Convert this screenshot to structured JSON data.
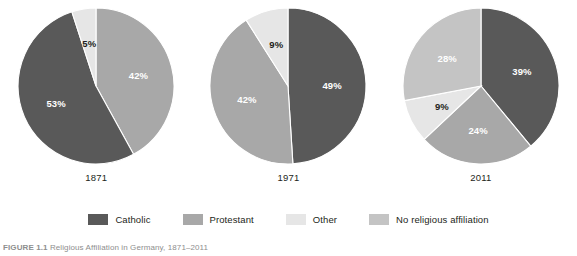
{
  "figure": {
    "caption_number": "FIGURE 1.1",
    "caption_text": "Religious Affiliation in Germany, 1871–2011"
  },
  "legend": {
    "position": "bottom-center",
    "items": [
      {
        "label": "Catholic",
        "color": "#595959",
        "swatch_name": "legend-swatch-catholic"
      },
      {
        "label": "Protestant",
        "color": "#a8a8a8",
        "swatch_name": "legend-swatch-protestant"
      },
      {
        "label": "Other",
        "color": "#e6e6e6",
        "swatch_name": "legend-swatch-other"
      },
      {
        "label": "No religious affiliation",
        "color": "#c4c4c4",
        "swatch_name": "legend-swatch-no-religious-affiliation"
      }
    ]
  },
  "colors": {
    "catholic": "#595959",
    "protestant": "#a8a8a8",
    "other": "#e6e6e6",
    "no_religious_affiliation": "#c4c4c4",
    "separator": "#ffffff",
    "label_on_dark": "#ffffff",
    "label_on_light": "#231f20"
  },
  "chart_data": [
    {
      "type": "pie",
      "title": "1871",
      "categories": [
        "Protestant",
        "Catholic",
        "Other"
      ],
      "values": [
        42,
        53,
        5
      ],
      "labels": [
        "42%",
        "53%",
        "5%"
      ],
      "colors": [
        "#a8a8a8",
        "#595959",
        "#e6e6e6"
      ],
      "start_angle_deg": 0,
      "label_text_colors": [
        "#ffffff",
        "#ffffff",
        "#231f20"
      ]
    },
    {
      "type": "pie",
      "title": "1971",
      "categories": [
        "Catholic",
        "Protestant",
        "Other"
      ],
      "values": [
        49,
        42,
        9
      ],
      "labels": [
        "49%",
        "42%",
        "9%"
      ],
      "colors": [
        "#595959",
        "#a8a8a8",
        "#e6e6e6"
      ],
      "start_angle_deg": 0,
      "label_text_colors": [
        "#ffffff",
        "#ffffff",
        "#231f20"
      ]
    },
    {
      "type": "pie",
      "title": "2011",
      "categories": [
        "Catholic",
        "Protestant",
        "Other",
        "No religious affiliation"
      ],
      "values": [
        39,
        24,
        9,
        28
      ],
      "labels": [
        "39%",
        "24%",
        "9%",
        "28%"
      ],
      "colors": [
        "#595959",
        "#a8a8a8",
        "#e6e6e6",
        "#c4c4c4"
      ],
      "start_angle_deg": 0,
      "label_text_colors": [
        "#ffffff",
        "#ffffff",
        "#231f20",
        "#ffffff"
      ]
    }
  ]
}
